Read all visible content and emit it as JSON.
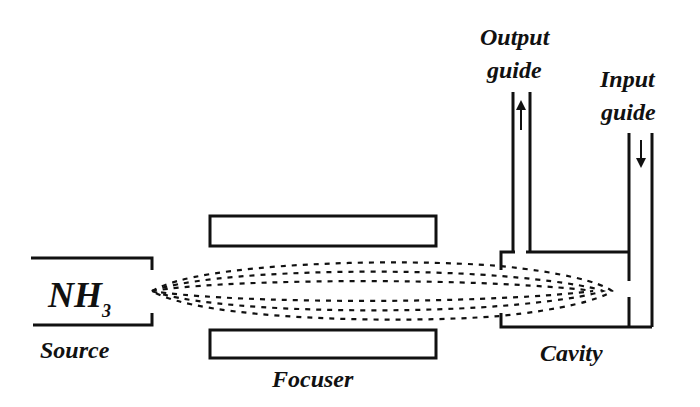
{
  "diagram": {
    "colors": {
      "line": "#111111",
      "background": "#ffffff"
    },
    "labels": {
      "source_formula": "NH",
      "source_subscript": "3",
      "source": "Source",
      "focuser": "Focuser",
      "cavity": "Cavity",
      "output_guide_line1": "Output",
      "output_guide_line2": "guide",
      "input_guide_line1": "Input",
      "input_guide_line2": "guide"
    },
    "arrows": {
      "output_direction": "up",
      "input_direction": "down"
    }
  }
}
